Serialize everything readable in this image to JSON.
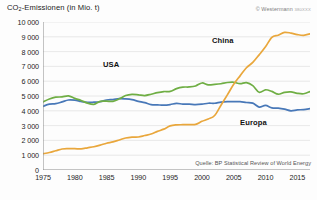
{
  "chart_data": {
    "type": "line",
    "title": "CO2-Emissionen (in Mio. t)",
    "title_prefix": "CO",
    "title_sub": "2",
    "title_suffix": "-Emissionen (in Mio. t)",
    "xlabel": "",
    "ylabel": "",
    "xlim": [
      1975,
      2017
    ],
    "ylim": [
      0,
      10000
    ],
    "grid": true,
    "legend_position": "inline-labels",
    "yticks": [
      0,
      1000,
      2000,
      3000,
      4000,
      5000,
      6000,
      7000,
      8000,
      9000,
      10000
    ],
    "ytick_labels": [
      "0",
      "1 000",
      "2 000",
      "3 000",
      "4 000",
      "5 000",
      "6 000",
      "7 000",
      "8 000",
      "9 000",
      "10 000"
    ],
    "xticks": [
      1975,
      1980,
      1985,
      1990,
      1995,
      2000,
      2005,
      2010,
      2015
    ],
    "xtick_labels": [
      "1975",
      "1980",
      "1985",
      "1990",
      "1995",
      "2000",
      "2005",
      "2010",
      "2015"
    ],
    "x": [
      1975,
      1976,
      1977,
      1978,
      1979,
      1980,
      1981,
      1982,
      1983,
      1984,
      1985,
      1986,
      1987,
      1988,
      1989,
      1990,
      1991,
      1992,
      1993,
      1994,
      1995,
      1996,
      1997,
      1998,
      1999,
      2000,
      2001,
      2002,
      2003,
      2004,
      2005,
      2006,
      2007,
      2008,
      2009,
      2010,
      2011,
      2012,
      2013,
      2014,
      2015,
      2016,
      2017
    ],
    "series": [
      {
        "name": "China",
        "color": "#e9a73c",
        "values": [
          1100,
          1180,
          1300,
          1420,
          1440,
          1440,
          1430,
          1500,
          1570,
          1680,
          1810,
          1900,
          2030,
          2160,
          2220,
          2230,
          2330,
          2430,
          2610,
          2760,
          2980,
          3050,
          3060,
          3070,
          3080,
          3290,
          3450,
          3680,
          4380,
          5080,
          5790,
          6360,
          6910,
          7270,
          7780,
          8320,
          8960,
          9110,
          9300,
          9250,
          9150,
          9100,
          9200
        ]
      },
      {
        "name": "USA",
        "color": "#6fae44",
        "values": [
          4600,
          4800,
          4920,
          4940,
          5010,
          4840,
          4700,
          4520,
          4440,
          4640,
          4650,
          4640,
          4810,
          5030,
          5110,
          5080,
          5030,
          5120,
          5230,
          5300,
          5310,
          5500,
          5600,
          5610,
          5680,
          5880,
          5750,
          5780,
          5830,
          5910,
          5930,
          5830,
          5900,
          5700,
          5250,
          5420,
          5310,
          5120,
          5250,
          5280,
          5180,
          5150,
          5300
        ]
      },
      {
        "name": "Europa",
        "color": "#4878b8",
        "values": [
          4300,
          4450,
          4480,
          4600,
          4730,
          4720,
          4630,
          4570,
          4580,
          4610,
          4730,
          4760,
          4820,
          4800,
          4750,
          4640,
          4550,
          4420,
          4400,
          4380,
          4420,
          4500,
          4450,
          4450,
          4420,
          4450,
          4510,
          4510,
          4590,
          4620,
          4620,
          4620,
          4560,
          4520,
          4250,
          4360,
          4200,
          4180,
          4110,
          4000,
          4060,
          4080,
          4150
        ]
      }
    ],
    "annotations": [
      {
        "text": "USA",
        "series": "USA"
      },
      {
        "text": "China",
        "series": "China"
      },
      {
        "text": "Europa",
        "series": "Europa"
      }
    ],
    "source": "Quelle: BP Statistical Review of World Energy",
    "copyright": "© Westermann",
    "copyright_code": "380XXX"
  }
}
